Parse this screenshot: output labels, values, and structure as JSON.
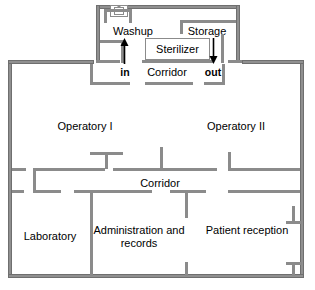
{
  "diagram": {
    "wall_color": "#8b8b8b",
    "background_color": "#ffffff",
    "text_color": "#000000"
  },
  "rooms": [
    {
      "id": "washup",
      "label": "Washup"
    },
    {
      "id": "storage",
      "label": "Storage"
    },
    {
      "id": "sterilizer",
      "label": "Sterilizer"
    },
    {
      "id": "corridor_top",
      "label": "Corridor"
    },
    {
      "id": "operatory_1",
      "label": "Operatory I"
    },
    {
      "id": "operatory_2",
      "label": "Operatory II"
    },
    {
      "id": "corridor_mid",
      "label": "Corridor"
    },
    {
      "id": "laboratory",
      "label": "Laboratory"
    },
    {
      "id": "administration",
      "label": "Administration and records"
    },
    {
      "id": "reception",
      "label": "Patient reception"
    }
  ],
  "flow": {
    "in_label": "in",
    "out_label": "out"
  },
  "icons": {
    "fixture": "sink-icon",
    "in_arrow": "arrow-up-icon",
    "out_arrow": "arrow-down-icon"
  }
}
